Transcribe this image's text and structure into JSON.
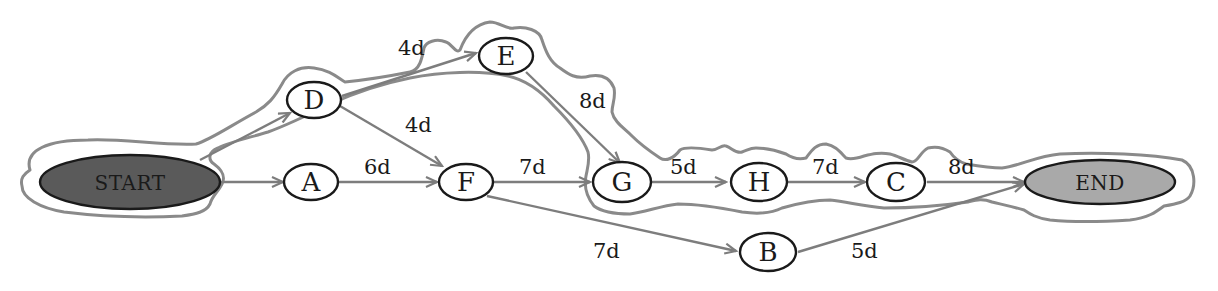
{
  "diagram": {
    "type": "network-diagram",
    "colors": {
      "start_fill": "#5a5a5a",
      "end_fill": "#a9a9a9",
      "node_fill": "#ffffff",
      "edge": "#7d7d7d",
      "critical_path_outline": "#8a8a8a"
    },
    "nodes": {
      "start": {
        "label": "START"
      },
      "a": {
        "label": "A"
      },
      "b": {
        "label": "B"
      },
      "c": {
        "label": "C"
      },
      "d": {
        "label": "D"
      },
      "e": {
        "label": "E"
      },
      "f": {
        "label": "F"
      },
      "g": {
        "label": "G"
      },
      "h": {
        "label": "H"
      },
      "end": {
        "label": "END"
      }
    },
    "edges": {
      "start_a": {
        "from": "START",
        "to": "A",
        "label": ""
      },
      "start_d": {
        "from": "START",
        "to": "D",
        "label": ""
      },
      "d_e": {
        "from": "D",
        "to": "E",
        "label": "4d"
      },
      "d_f": {
        "from": "D",
        "to": "F",
        "label": "4d"
      },
      "a_f": {
        "from": "A",
        "to": "F",
        "label": "6d"
      },
      "e_g": {
        "from": "E",
        "to": "G",
        "label": "8d"
      },
      "f_g": {
        "from": "F",
        "to": "G",
        "label": "7d"
      },
      "f_b": {
        "from": "F",
        "to": "B",
        "label": "7d"
      },
      "g_h": {
        "from": "G",
        "to": "H",
        "label": "5d"
      },
      "h_c": {
        "from": "H",
        "to": "C",
        "label": "7d"
      },
      "c_end": {
        "from": "C",
        "to": "END",
        "label": "8d"
      },
      "b_end": {
        "from": "B",
        "to": "END",
        "label": "5d"
      }
    },
    "critical_path": [
      "START",
      "D",
      "E",
      "G",
      "H",
      "C",
      "END"
    ]
  }
}
